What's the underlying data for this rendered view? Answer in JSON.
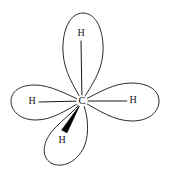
{
  "diagram": {
    "type": "chemical-structure",
    "central_atom": {
      "label": "C",
      "name": "carbon",
      "x": 82,
      "y": 101
    },
    "colors": {
      "background": "#ffffff",
      "outline": "#2b2b2b",
      "bond": "#1a1a1a",
      "wedge": "#000000",
      "text": "#111111"
    },
    "lobes": [
      {
        "name": "lobe-top",
        "direction": "up",
        "hydrogen_label": "H",
        "label_x": 81,
        "label_y": 34,
        "bond_style": "plain-line"
      },
      {
        "name": "lobe-left",
        "direction": "left",
        "hydrogen_label": "H",
        "label_x": 32,
        "label_y": 102,
        "bond_style": "plain-line"
      },
      {
        "name": "lobe-right",
        "direction": "right",
        "hydrogen_label": "H",
        "label_x": 133,
        "label_y": 101,
        "bond_style": "plain-line"
      },
      {
        "name": "lobe-bottom-left",
        "direction": "down-left",
        "hydrogen_label": "H",
        "label_x": 62,
        "label_y": 141,
        "bond_style": "bold-wedge"
      }
    ]
  }
}
